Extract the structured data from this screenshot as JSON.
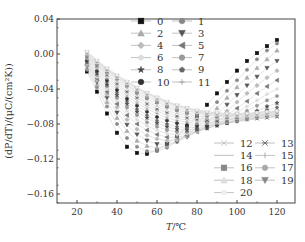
{
  "chart_data": {
    "type": "line",
    "title": "",
    "xlabel": "T/℃",
    "ylabel": "(dP/dT)/(μC/(cm²K))",
    "xlim": [
      12,
      130
    ],
    "ylim": [
      -0.17,
      0.04
    ],
    "xticks": [
      20,
      40,
      60,
      80,
      100,
      120
    ],
    "xtick_labels": [
      "20",
      "40",
      "60",
      "80",
      "100",
      "120"
    ],
    "yticks": [
      0.04,
      0.0,
      -0.04,
      -0.08,
      -0.12,
      -0.16
    ],
    "ytick_labels": [
      "0.04",
      "0.00",
      "−0.04",
      "−0.08",
      "−0.12",
      "−0.16"
    ],
    "grid": false,
    "legend_position": "upper-center and lower-right (two blocks)",
    "x": [
      25,
      30,
      35,
      40,
      45,
      50,
      55,
      60,
      65,
      70,
      75,
      80,
      85,
      90,
      95,
      100,
      105,
      110,
      115,
      120
    ],
    "series": [
      {
        "name": "0",
        "marker": "square",
        "color": "#111111",
        "values": [
          -0.02,
          -0.043,
          -0.068,
          -0.09,
          -0.106,
          -0.113,
          -0.114,
          -0.11,
          -0.103,
          -0.094,
          -0.083,
          -0.071,
          -0.058,
          -0.045,
          -0.032,
          -0.019,
          -0.008,
          0.001,
          0.009,
          0.016
        ]
      },
      {
        "name": "1",
        "marker": "circle",
        "color": "#888888",
        "values": [
          -0.018,
          -0.038,
          -0.06,
          -0.08,
          -0.096,
          -0.106,
          -0.111,
          -0.111,
          -0.107,
          -0.1,
          -0.091,
          -0.08,
          -0.068,
          -0.055,
          -0.042,
          -0.03,
          -0.018,
          -0.006,
          0.004,
          0.012
        ]
      },
      {
        "name": "2",
        "marker": "triangle-up",
        "color": "#aaaaaa",
        "values": [
          -0.016,
          -0.035,
          -0.055,
          -0.073,
          -0.088,
          -0.099,
          -0.105,
          -0.107,
          -0.105,
          -0.1,
          -0.093,
          -0.084,
          -0.073,
          -0.062,
          -0.05,
          -0.038,
          -0.027,
          -0.016,
          -0.006,
          0.004
        ]
      },
      {
        "name": "3",
        "marker": "triangle-down",
        "color": "#555555",
        "values": [
          -0.014,
          -0.032,
          -0.05,
          -0.067,
          -0.081,
          -0.092,
          -0.099,
          -0.103,
          -0.103,
          -0.1,
          -0.095,
          -0.088,
          -0.079,
          -0.069,
          -0.058,
          -0.047,
          -0.036,
          -0.026,
          -0.016,
          -0.008
        ]
      },
      {
        "name": "4",
        "marker": "diamond",
        "color": "#bbbbbb",
        "values": [
          -0.013,
          -0.03,
          -0.046,
          -0.061,
          -0.075,
          -0.086,
          -0.093,
          -0.097,
          -0.099,
          -0.098,
          -0.094,
          -0.089,
          -0.082,
          -0.074,
          -0.065,
          -0.055,
          -0.045,
          -0.036,
          -0.027,
          -0.019
        ]
      },
      {
        "name": "5",
        "marker": "triangle-left",
        "color": "#777777",
        "values": [
          -0.012,
          -0.028,
          -0.043,
          -0.057,
          -0.07,
          -0.08,
          -0.087,
          -0.092,
          -0.095,
          -0.095,
          -0.093,
          -0.089,
          -0.084,
          -0.077,
          -0.07,
          -0.062,
          -0.054,
          -0.045,
          -0.037,
          -0.03
        ]
      },
      {
        "name": "6",
        "marker": "hexagon",
        "color": "#dddddd",
        "values": [
          -0.011,
          -0.026,
          -0.04,
          -0.053,
          -0.065,
          -0.075,
          -0.082,
          -0.087,
          -0.091,
          -0.092,
          -0.091,
          -0.089,
          -0.085,
          -0.08,
          -0.074,
          -0.067,
          -0.06,
          -0.053,
          -0.046,
          -0.04
        ]
      },
      {
        "name": "7",
        "marker": "circle",
        "color": "#999999",
        "values": [
          -0.01,
          -0.024,
          -0.037,
          -0.05,
          -0.061,
          -0.07,
          -0.078,
          -0.083,
          -0.087,
          -0.089,
          -0.089,
          -0.088,
          -0.085,
          -0.081,
          -0.077,
          -0.071,
          -0.065,
          -0.059,
          -0.053,
          -0.048
        ]
      },
      {
        "name": "8",
        "marker": "star",
        "color": "#444444",
        "values": [
          -0.009,
          -0.022,
          -0.035,
          -0.047,
          -0.057,
          -0.066,
          -0.073,
          -0.079,
          -0.083,
          -0.086,
          -0.087,
          -0.086,
          -0.085,
          -0.082,
          -0.079,
          -0.075,
          -0.07,
          -0.065,
          -0.06,
          -0.056
        ]
      },
      {
        "name": "9",
        "marker": "pentagon",
        "color": "#666666",
        "values": [
          -0.008,
          -0.02,
          -0.032,
          -0.044,
          -0.054,
          -0.063,
          -0.07,
          -0.076,
          -0.08,
          -0.083,
          -0.084,
          -0.084,
          -0.083,
          -0.081,
          -0.079,
          -0.076,
          -0.072,
          -0.068,
          -0.064,
          -0.061
        ]
      },
      {
        "name": "10",
        "marker": "circle-half",
        "color": "#333333",
        "values": [
          -0.007,
          -0.019,
          -0.03,
          -0.041,
          -0.051,
          -0.059,
          -0.066,
          -0.072,
          -0.076,
          -0.079,
          -0.081,
          -0.082,
          -0.082,
          -0.081,
          -0.079,
          -0.077,
          -0.074,
          -0.071,
          -0.068,
          -0.065
        ]
      },
      {
        "name": "11",
        "marker": "plus",
        "color": "#999999",
        "values": [
          -0.006,
          -0.017,
          -0.028,
          -0.038,
          -0.048,
          -0.056,
          -0.063,
          -0.068,
          -0.073,
          -0.076,
          -0.078,
          -0.08,
          -0.08,
          -0.08,
          -0.079,
          -0.077,
          -0.075,
          -0.073,
          -0.071,
          -0.069
        ]
      },
      {
        "name": "12",
        "marker": "x",
        "color": "#bbbbbb",
        "values": [
          -0.005,
          -0.016,
          -0.026,
          -0.036,
          -0.045,
          -0.053,
          -0.06,
          -0.065,
          -0.07,
          -0.073,
          -0.076,
          -0.077,
          -0.078,
          -0.079,
          -0.078,
          -0.077,
          -0.076,
          -0.074,
          -0.073,
          -0.071
        ]
      },
      {
        "name": "13",
        "marker": "asterisk",
        "color": "#666666",
        "values": [
          -0.004,
          -0.014,
          -0.024,
          -0.034,
          -0.043,
          -0.05,
          -0.057,
          -0.063,
          -0.067,
          -0.071,
          -0.073,
          -0.075,
          -0.076,
          -0.077,
          -0.077,
          -0.076,
          -0.075,
          -0.074,
          -0.073,
          -0.072
        ]
      },
      {
        "name": "14",
        "marker": "dash",
        "color": "#cccccc",
        "values": [
          -0.003,
          -0.013,
          -0.023,
          -0.032,
          -0.04,
          -0.048,
          -0.055,
          -0.06,
          -0.065,
          -0.068,
          -0.071,
          -0.073,
          -0.074,
          -0.075,
          -0.075,
          -0.075,
          -0.074,
          -0.073,
          -0.072,
          -0.071
        ]
      },
      {
        "name": "15",
        "marker": "vline",
        "color": "#999999",
        "values": [
          -0.002,
          -0.012,
          -0.021,
          -0.03,
          -0.038,
          -0.046,
          -0.052,
          -0.058,
          -0.062,
          -0.066,
          -0.069,
          -0.071,
          -0.072,
          -0.073,
          -0.074,
          -0.074,
          -0.073,
          -0.072,
          -0.071,
          -0.07
        ]
      },
      {
        "name": "16",
        "marker": "square",
        "color": "#888888",
        "values": [
          -0.001,
          -0.011,
          -0.02,
          -0.028,
          -0.036,
          -0.044,
          -0.05,
          -0.055,
          -0.06,
          -0.064,
          -0.067,
          -0.069,
          -0.07,
          -0.071,
          -0.072,
          -0.072,
          -0.072,
          -0.071,
          -0.07,
          -0.069
        ]
      },
      {
        "name": "17",
        "marker": "circle",
        "color": "#aaaaaa",
        "values": [
          0.0,
          -0.01,
          -0.019,
          -0.027,
          -0.035,
          -0.042,
          -0.048,
          -0.053,
          -0.058,
          -0.062,
          -0.065,
          -0.067,
          -0.069,
          -0.07,
          -0.071,
          -0.071,
          -0.071,
          -0.07,
          -0.069,
          -0.068
        ]
      },
      {
        "name": "18",
        "marker": "triangle-up",
        "color": "#dddddd",
        "values": [
          0.001,
          -0.009,
          -0.018,
          -0.026,
          -0.033,
          -0.04,
          -0.046,
          -0.051,
          -0.056,
          -0.06,
          -0.063,
          -0.066,
          -0.068,
          -0.069,
          -0.07,
          -0.07,
          -0.07,
          -0.069,
          -0.068,
          -0.067
        ]
      },
      {
        "name": "19",
        "marker": "triangle-down",
        "color": "#888888",
        "values": [
          0.002,
          -0.008,
          -0.017,
          -0.025,
          -0.032,
          -0.039,
          -0.045,
          -0.05,
          -0.055,
          -0.059,
          -0.062,
          -0.065,
          -0.067,
          -0.068,
          -0.069,
          -0.069,
          -0.069,
          -0.068,
          -0.067,
          -0.066
        ]
      },
      {
        "name": "20",
        "marker": "hexagon",
        "color": "#eeeeee",
        "values": [
          0.003,
          -0.007,
          -0.016,
          -0.024,
          -0.031,
          -0.038,
          -0.044,
          -0.049,
          -0.054,
          -0.058,
          -0.061,
          -0.064,
          -0.066,
          -0.067,
          -0.068,
          -0.068,
          -0.068,
          -0.067,
          -0.066,
          -0.065
        ]
      }
    ]
  },
  "axes": {
    "xlabel_italic": "T",
    "xlabel_unit": "/℃",
    "ylabel": "(dP/dT)/(μC/(cm²K))"
  },
  "legend": {
    "upper": [
      {
        "label": "0"
      },
      {
        "label": "1"
      },
      {
        "label": "2"
      },
      {
        "label": "3"
      },
      {
        "label": "4"
      },
      {
        "label": "5"
      },
      {
        "label": "6"
      },
      {
        "label": "7"
      },
      {
        "label": "8"
      },
      {
        "label": "9"
      },
      {
        "label": "10"
      },
      {
        "label": "11"
      }
    ],
    "lower": [
      {
        "label": "12"
      },
      {
        "label": "13"
      },
      {
        "label": "14"
      },
      {
        "label": "15"
      },
      {
        "label": "16"
      },
      {
        "label": "17"
      },
      {
        "label": "18"
      },
      {
        "label": "19"
      },
      {
        "label": "20"
      }
    ]
  }
}
